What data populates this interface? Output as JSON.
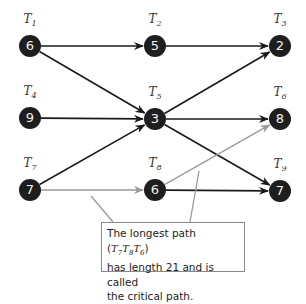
{
  "diagram": {
    "type": "activity-network",
    "nodes": [
      {
        "id": "T1",
        "label_base": "T",
        "label_sub": "1",
        "value": "6",
        "x": 30,
        "y": 46
      },
      {
        "id": "T2",
        "label_base": "T",
        "label_sub": "2",
        "value": "5",
        "x": 155,
        "y": 46
      },
      {
        "id": "T3",
        "label_base": "T",
        "label_sub": "3",
        "value": "2",
        "x": 280,
        "y": 46
      },
      {
        "id": "T4",
        "label_base": "T",
        "label_sub": "4",
        "value": "9",
        "x": 30,
        "y": 118
      },
      {
        "id": "T5",
        "label_base": "T",
        "label_sub": "5",
        "value": "3",
        "x": 155,
        "y": 119
      },
      {
        "id": "T6",
        "label_base": "T",
        "label_sub": "6",
        "value": "8",
        "x": 280,
        "y": 119
      },
      {
        "id": "T7",
        "label_base": "T",
        "label_sub": "7",
        "value": "7",
        "x": 30,
        "y": 190
      },
      {
        "id": "T8",
        "label_base": "T",
        "label_sub": "8",
        "value": "6",
        "x": 155,
        "y": 190
      },
      {
        "id": "T9",
        "label_base": "T",
        "label_sub": "9",
        "value": "7",
        "x": 280,
        "y": 191
      }
    ],
    "edges": [
      {
        "from": "T1",
        "to": "T2",
        "critical": false
      },
      {
        "from": "T1",
        "to": "T5",
        "critical": false
      },
      {
        "from": "T2",
        "to": "T3",
        "critical": false
      },
      {
        "from": "T4",
        "to": "T5",
        "critical": false
      },
      {
        "from": "T7",
        "to": "T5",
        "critical": false
      },
      {
        "from": "T5",
        "to": "T3",
        "critical": false
      },
      {
        "from": "T5",
        "to": "T6",
        "critical": false
      },
      {
        "from": "T5",
        "to": "T9",
        "critical": false
      },
      {
        "from": "T8",
        "to": "T9",
        "critical": false
      },
      {
        "from": "T7",
        "to": "T8",
        "critical": true
      },
      {
        "from": "T8",
        "to": "T6",
        "critical": true
      }
    ],
    "colors": {
      "node_fill": "#1e1e1e",
      "node_text": "#f2f2f2",
      "edge": "#1a1a1a",
      "critical_edge": "#9a9a9a",
      "callout_border": "#888888"
    }
  },
  "callout": {
    "line1_prefix": "The longest path (",
    "path_nodes": [
      {
        "base": "T",
        "sub": "7"
      },
      {
        "base": "T",
        "sub": "8"
      },
      {
        "base": "T",
        "sub": "6"
      }
    ],
    "line1_suffix": ")",
    "line2": "has length 21 and is called",
    "line3": "the critical path.",
    "critical_path_length": 21
  }
}
